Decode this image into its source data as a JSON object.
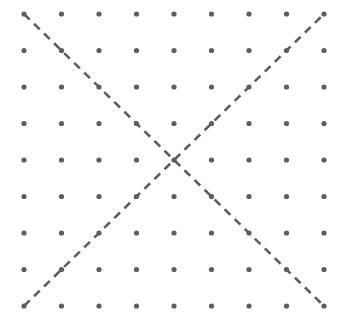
{
  "figure": {
    "title": "",
    "type": "dot-grid-with-dashed-diagonals",
    "background_color": "#ffffff",
    "width": 346,
    "height": 323
  },
  "chart_data": {
    "type": "scatter",
    "title": "",
    "subtitle": "",
    "xlabel": "",
    "ylabel": "",
    "grid": false,
    "legend": null,
    "axis_visible": false,
    "tick_labels_x": [],
    "tick_labels_y": [],
    "xlim": [
      0,
      8
    ],
    "ylim": [
      0,
      8
    ],
    "dot_grid": {
      "rows": 9,
      "cols": 9,
      "total_points": 81,
      "dot_color": "#5e5e5e",
      "dot_radius": 2.6,
      "col_x": [
        24,
        61.5,
        99,
        136.5,
        174,
        211.5,
        249,
        286.5,
        324
      ],
      "row_y": [
        14,
        50.5,
        87,
        123.5,
        160,
        196.5,
        233,
        269.5,
        306
      ]
    },
    "annotations": [
      {
        "name": "diagonal-down-right",
        "style": "dashed",
        "color": "#5e5e5e",
        "width": 2.6,
        "dash": "8,6",
        "x1": 24,
        "y1": 14,
        "x2": 324,
        "y2": 306,
        "grid_from": [
          0,
          8
        ],
        "grid_to": [
          8,
          0
        ]
      },
      {
        "name": "diagonal-up-right",
        "style": "dashed",
        "color": "#5e5e5e",
        "width": 2.6,
        "dash": "8,6",
        "x1": 24,
        "y1": 306,
        "x2": 324,
        "y2": 14,
        "grid_from": [
          0,
          0
        ],
        "grid_to": [
          8,
          8
        ]
      }
    ],
    "intersection_point": {
      "x": 174,
      "y": 160,
      "grid": [
        4,
        4
      ]
    }
  }
}
